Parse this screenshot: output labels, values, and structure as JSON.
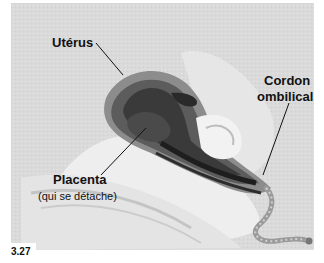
{
  "figure": {
    "number": "3.27",
    "background_color": "#dcdcdc"
  },
  "labels": {
    "uterus": {
      "text": "Utérus"
    },
    "cord": {
      "line1": "Cordon",
      "line2": "ombilical"
    },
    "placenta": {
      "text": "Placenta",
      "note": "(qui se détache)"
    }
  }
}
